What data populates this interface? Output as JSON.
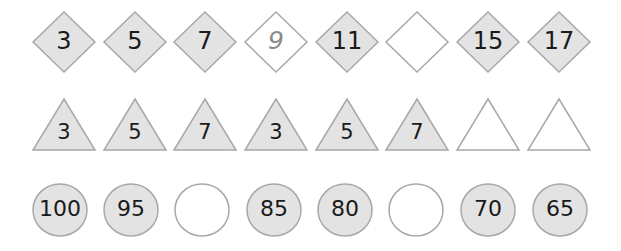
{
  "colors": {
    "filled": "#e3e3e3",
    "empty": "#ffffff",
    "stroke": "#a8a8a8",
    "text": "#1a1a1a",
    "hint_text": "#8a8a8a"
  },
  "rows": {
    "diamonds": {
      "shape": "diamond",
      "items": [
        {
          "value": "3",
          "filled": true
        },
        {
          "value": "5",
          "filled": true
        },
        {
          "value": "7",
          "filled": true
        },
        {
          "value": "9",
          "filled": false,
          "hint": true
        },
        {
          "value": "11",
          "filled": true
        },
        {
          "value": "",
          "filled": false
        },
        {
          "value": "15",
          "filled": true
        },
        {
          "value": "17",
          "filled": true
        }
      ]
    },
    "triangles": {
      "shape": "triangle",
      "items": [
        {
          "value": "3",
          "filled": true
        },
        {
          "value": "5",
          "filled": true
        },
        {
          "value": "7",
          "filled": true
        },
        {
          "value": "3",
          "filled": true
        },
        {
          "value": "5",
          "filled": true
        },
        {
          "value": "7",
          "filled": true
        },
        {
          "value": "",
          "filled": false
        },
        {
          "value": "",
          "filled": false
        }
      ]
    },
    "circles": {
      "shape": "circle",
      "items": [
        {
          "value": "100",
          "filled": true
        },
        {
          "value": "95",
          "filled": true
        },
        {
          "value": "",
          "filled": false
        },
        {
          "value": "85",
          "filled": true
        },
        {
          "value": "80",
          "filled": true
        },
        {
          "value": "",
          "filled": false
        },
        {
          "value": "70",
          "filled": true
        },
        {
          "value": "65",
          "filled": true
        }
      ]
    }
  }
}
